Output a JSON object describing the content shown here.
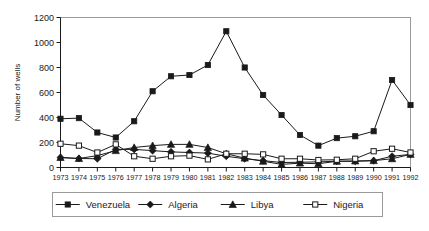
{
  "chart_data": {
    "type": "line",
    "title": "",
    "xlabel": "",
    "ylabel": "Number of wells",
    "xlim": [
      1973,
      1992
    ],
    "ylim": [
      0,
      1200
    ],
    "yticks": [
      0,
      200,
      400,
      600,
      800,
      1000,
      1200
    ],
    "grid": false,
    "legend_position": "bottom",
    "categories": [
      1973,
      1974,
      1975,
      1976,
      1977,
      1978,
      1979,
      1980,
      1981,
      1982,
      1983,
      1984,
      1985,
      1986,
      1987,
      1988,
      1989,
      1990,
      1991,
      1992
    ],
    "x": [
      "1973",
      "1974",
      "1975",
      "1976",
      "1977",
      "1978",
      "1979",
      "1980",
      "1981",
      "1982",
      "1983",
      "1984",
      "1985",
      "1986",
      "1987",
      "1988",
      "1989",
      "1990",
      "1991",
      "1992"
    ],
    "series": [
      {
        "name": "Venezuela",
        "marker": "filled-square",
        "color": "#1a1a1a",
        "values": [
          390,
          395,
          280,
          240,
          370,
          610,
          730,
          740,
          820,
          1090,
          800,
          580,
          420,
          260,
          175,
          235,
          250,
          290,
          700,
          500
        ]
      },
      {
        "name": "Algeria",
        "marker": "filled-diamond",
        "color": "#1a1a1a",
        "values": [
          80,
          72,
          70,
          145,
          145,
          135,
          125,
          120,
          115,
          90,
          70,
          55,
          40,
          42,
          45,
          50,
          50,
          55,
          90,
          105
        ]
      },
      {
        "name": "Libya",
        "marker": "filled-triangle",
        "color": "#1a1a1a",
        "values": [
          80,
          72,
          95,
          135,
          160,
          175,
          185,
          185,
          160,
          110,
          75,
          50,
          25,
          35,
          30,
          50,
          52,
          55,
          70,
          105
        ]
      },
      {
        "name": "Nigeria",
        "marker": "open-square",
        "color": "#1a1a1a",
        "values": [
          190,
          175,
          120,
          185,
          90,
          70,
          90,
          95,
          65,
          110,
          110,
          105,
          70,
          70,
          60,
          62,
          70,
          130,
          150,
          120
        ]
      }
    ]
  },
  "axis": {
    "ylabel": "Number of wells",
    "yticks": [
      "0",
      "200",
      "400",
      "600",
      "800",
      "1000",
      "1200"
    ],
    "xticks": [
      "1973",
      "1974",
      "1975",
      "1976",
      "1977",
      "1978",
      "1979",
      "1980",
      "1981",
      "1982",
      "1983",
      "1984",
      "1985",
      "1986",
      "1987",
      "1988",
      "1989",
      "1990",
      "1991",
      "1992"
    ]
  },
  "legend": {
    "items": [
      {
        "label": "Venezuela",
        "marker": "filled-square"
      },
      {
        "label": "Algeria",
        "marker": "filled-diamond"
      },
      {
        "label": "Libya",
        "marker": "filled-triangle"
      },
      {
        "label": "Nigeria",
        "marker": "open-square"
      }
    ]
  },
  "colors": {
    "ink": "#1a1a1a",
    "frame": "#9a9a9a",
    "background": "#ffffff"
  }
}
